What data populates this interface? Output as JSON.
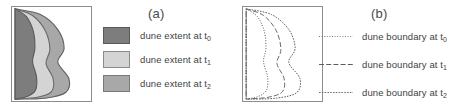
{
  "figure": {
    "panels": [
      {
        "id": "a",
        "label": "(a)",
        "legend_type": "filled-polygon-swatches",
        "legend": [
          {
            "label": "dune extent at t",
            "subscript": "0",
            "color": "#7d7d7d",
            "border": "#5a5a5a",
            "swatch_name": "legend-swatch-t0"
          },
          {
            "label": "dune extent at t",
            "subscript": "1",
            "color": "#d4d4d4",
            "border": "#8a8a8a",
            "swatch_name": "legend-swatch-t1"
          },
          {
            "label": "dune extent at t",
            "subscript": "2",
            "color": "#a8a8a8",
            "border": "#7a7a7a",
            "swatch_name": "legend-swatch-t2"
          }
        ]
      },
      {
        "id": "b",
        "label": "(b)",
        "legend_type": "line-style-samples",
        "legend": [
          {
            "label": "dune boundary at t",
            "subscript": "0",
            "dash": "1,1.6",
            "width": "0.9",
            "color": "#6f6f6f",
            "sample_name": "legend-line-t0"
          },
          {
            "label": "dune boundary at t",
            "subscript": "1",
            "dash": "5,2.2",
            "width": "1.1",
            "color": "#5f5f5f",
            "sample_name": "legend-line-t1"
          },
          {
            "label": "dune boundary at t",
            "subscript": "2",
            "dash": "1.6,1.2",
            "width": "1.0",
            "color": "#707070",
            "sample_name": "legend-line-t2"
          }
        ]
      }
    ]
  },
  "chart_data": {
    "type": "area",
    "title": "",
    "xlabel": "",
    "ylabel": "",
    "grid": false,
    "axis_ticks": false,
    "xlim": [
      0,
      100
    ],
    "ylim": [
      0,
      100
    ],
    "legend_position": "right",
    "anchor_points": {
      "top": [
        4,
        2
      ],
      "bottom": [
        4,
        98
      ]
    },
    "series": [
      {
        "name": "dune extent at t0",
        "time": "t0",
        "fill": "#7d7d7d",
        "stroke": "#5a5a5a",
        "dash": "1,1.6",
        "z": 3,
        "max_width_pct": 40,
        "outline_points": [
          [
            4,
            2
          ],
          [
            18,
            10
          ],
          [
            27,
            26
          ],
          [
            29,
            44
          ],
          [
            26,
            58
          ],
          [
            31,
            74
          ],
          [
            30,
            88
          ],
          [
            20,
            95
          ],
          [
            4,
            98
          ]
        ]
      },
      {
        "name": "dune extent at t1",
        "time": "t1",
        "fill": "#d4d4d4",
        "stroke": "#6a6a6a",
        "dash": "5,2.2",
        "z": 2,
        "max_width_pct": 62,
        "outline_points": [
          [
            4,
            2
          ],
          [
            26,
            9
          ],
          [
            42,
            25
          ],
          [
            48,
            45
          ],
          [
            43,
            60
          ],
          [
            52,
            76
          ],
          [
            50,
            90
          ],
          [
            32,
            96
          ],
          [
            4,
            98
          ]
        ]
      },
      {
        "name": "dune extent at t2",
        "time": "t2",
        "fill": "#a8a8a8",
        "stroke": "#606060",
        "dash": "1.6,1.2",
        "z": 1,
        "max_width_pct": 82,
        "outline_points": [
          [
            4,
            2
          ],
          [
            36,
            8
          ],
          [
            58,
            24
          ],
          [
            66,
            44
          ],
          [
            58,
            59
          ],
          [
            72,
            76
          ],
          [
            68,
            91
          ],
          [
            42,
            97
          ],
          [
            4,
            98
          ]
        ]
      }
    ]
  }
}
